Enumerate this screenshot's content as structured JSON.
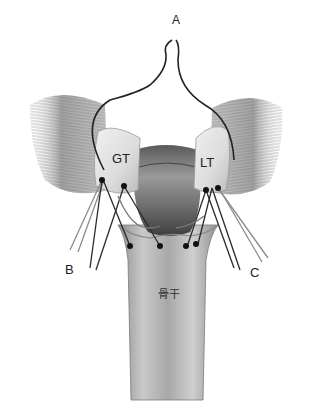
{
  "figure": {
    "type": "anatomical illustration",
    "labels": {
      "A": "A",
      "GT": "GT",
      "LT": "LT",
      "B": "B",
      "C": "C",
      "shaft": "骨干"
    },
    "colors": {
      "background": "#ffffff",
      "bone_light": "#e8e8e8",
      "bone_mid": "#bdbdbd",
      "bone_dark": "#6e6e6e",
      "muscle": "#8a8a8a",
      "suture": "#2a2a2a",
      "suture_light": "#8c8c8c",
      "knot": "#111111"
    }
  }
}
